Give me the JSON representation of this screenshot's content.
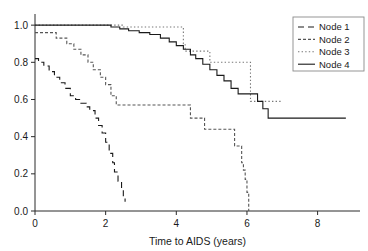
{
  "chart_data": {
    "type": "line",
    "title": "",
    "xlabel": "Time to AIDS (years)",
    "ylabel": "",
    "xlim": [
      0,
      9.2
    ],
    "ylim": [
      0,
      1.06
    ],
    "xticks": [
      0,
      2,
      4,
      6,
      8
    ],
    "xticklabels": [
      "0",
      "2",
      "4",
      "6",
      "8"
    ],
    "yticks": [
      0.0,
      0.2,
      0.4,
      0.6,
      0.8,
      1.0
    ],
    "yticklabels": [
      "0.0",
      "0.2",
      "0.4",
      "0.6",
      "0.8",
      "1.0"
    ],
    "grid": false,
    "legend_position": "top-right",
    "series": [
      {
        "name": "Node 1",
        "style": "dashed",
        "color": "#1a1a1a",
        "points": [
          [
            0.0,
            0.82
          ],
          [
            0.1,
            0.8
          ],
          [
            0.25,
            0.78
          ],
          [
            0.4,
            0.75
          ],
          [
            0.55,
            0.72
          ],
          [
            0.7,
            0.69
          ],
          [
            0.85,
            0.66
          ],
          [
            1.0,
            0.62
          ],
          [
            1.15,
            0.6
          ],
          [
            1.3,
            0.58
          ],
          [
            1.45,
            0.56
          ],
          [
            1.55,
            0.54
          ],
          [
            1.7,
            0.5
          ],
          [
            1.8,
            0.46
          ],
          [
            1.9,
            0.42
          ],
          [
            2.0,
            0.37
          ],
          [
            2.1,
            0.31
          ],
          [
            2.2,
            0.26
          ],
          [
            2.25,
            0.21
          ],
          [
            2.35,
            0.16
          ],
          [
            2.45,
            0.12
          ],
          [
            2.5,
            0.07
          ],
          [
            2.55,
            0.05
          ]
        ]
      },
      {
        "name": "Node 2",
        "style": "fine-dash",
        "color": "#555555",
        "points": [
          [
            0.0,
            0.96
          ],
          [
            0.55,
            0.96
          ],
          [
            0.6,
            0.93
          ],
          [
            0.85,
            0.93
          ],
          [
            0.9,
            0.9
          ],
          [
            1.05,
            0.9
          ],
          [
            1.1,
            0.87
          ],
          [
            1.25,
            0.87
          ],
          [
            1.3,
            0.84
          ],
          [
            1.45,
            0.84
          ],
          [
            1.5,
            0.8
          ],
          [
            1.6,
            0.8
          ],
          [
            1.65,
            0.76
          ],
          [
            1.8,
            0.76
          ],
          [
            1.85,
            0.72
          ],
          [
            1.95,
            0.72
          ],
          [
            2.0,
            0.68
          ],
          [
            2.1,
            0.68
          ],
          [
            2.15,
            0.62
          ],
          [
            2.25,
            0.62
          ],
          [
            2.3,
            0.57
          ],
          [
            4.35,
            0.57
          ],
          [
            4.4,
            0.5
          ],
          [
            4.75,
            0.5
          ],
          [
            4.8,
            0.44
          ],
          [
            5.6,
            0.44
          ],
          [
            5.65,
            0.35
          ],
          [
            5.8,
            0.35
          ],
          [
            5.85,
            0.26
          ],
          [
            5.9,
            0.22
          ],
          [
            5.95,
            0.17
          ],
          [
            6.0,
            0.1
          ],
          [
            6.05,
            0.0
          ]
        ]
      },
      {
        "name": "Node 3",
        "style": "dotted",
        "color": "#777777",
        "points": [
          [
            0.0,
            1.0
          ],
          [
            2.45,
            1.0
          ],
          [
            2.5,
            0.99
          ],
          [
            4.15,
            0.99
          ],
          [
            4.2,
            0.9
          ],
          [
            4.25,
            0.86
          ],
          [
            4.9,
            0.86
          ],
          [
            4.95,
            0.8
          ],
          [
            6.05,
            0.8
          ],
          [
            6.1,
            0.59
          ],
          [
            7.0,
            0.59
          ]
        ]
      },
      {
        "name": "Node 4",
        "style": "solid",
        "color": "#1a1a1a",
        "points": [
          [
            0.0,
            1.0
          ],
          [
            2.1,
            1.0
          ],
          [
            2.15,
            0.99
          ],
          [
            2.35,
            0.99
          ],
          [
            2.4,
            0.98
          ],
          [
            2.6,
            0.98
          ],
          [
            2.65,
            0.97
          ],
          [
            2.9,
            0.97
          ],
          [
            2.95,
            0.96
          ],
          [
            3.2,
            0.96
          ],
          [
            3.25,
            0.95
          ],
          [
            3.5,
            0.95
          ],
          [
            3.55,
            0.93
          ],
          [
            3.75,
            0.93
          ],
          [
            3.8,
            0.91
          ],
          [
            3.95,
            0.91
          ],
          [
            4.0,
            0.89
          ],
          [
            4.15,
            0.89
          ],
          [
            4.2,
            0.87
          ],
          [
            4.35,
            0.87
          ],
          [
            4.4,
            0.84
          ],
          [
            4.5,
            0.84
          ],
          [
            4.55,
            0.82
          ],
          [
            4.7,
            0.82
          ],
          [
            4.75,
            0.79
          ],
          [
            4.9,
            0.79
          ],
          [
            4.95,
            0.76
          ],
          [
            5.1,
            0.76
          ],
          [
            5.15,
            0.73
          ],
          [
            5.3,
            0.73
          ],
          [
            5.35,
            0.7
          ],
          [
            5.5,
            0.7
          ],
          [
            5.55,
            0.66
          ],
          [
            5.7,
            0.66
          ],
          [
            5.75,
            0.63
          ],
          [
            6.25,
            0.63
          ],
          [
            6.3,
            0.59
          ],
          [
            6.4,
            0.59
          ],
          [
            6.45,
            0.55
          ],
          [
            6.55,
            0.55
          ],
          [
            6.6,
            0.5
          ],
          [
            8.8,
            0.5
          ]
        ]
      }
    ]
  },
  "legend": {
    "entries": [
      {
        "label": "Node 1",
        "style": "dashed"
      },
      {
        "label": "Node 2",
        "style": "fine-dash"
      },
      {
        "label": "Node 3",
        "style": "dotted"
      },
      {
        "label": "Node 4",
        "style": "solid"
      }
    ]
  }
}
